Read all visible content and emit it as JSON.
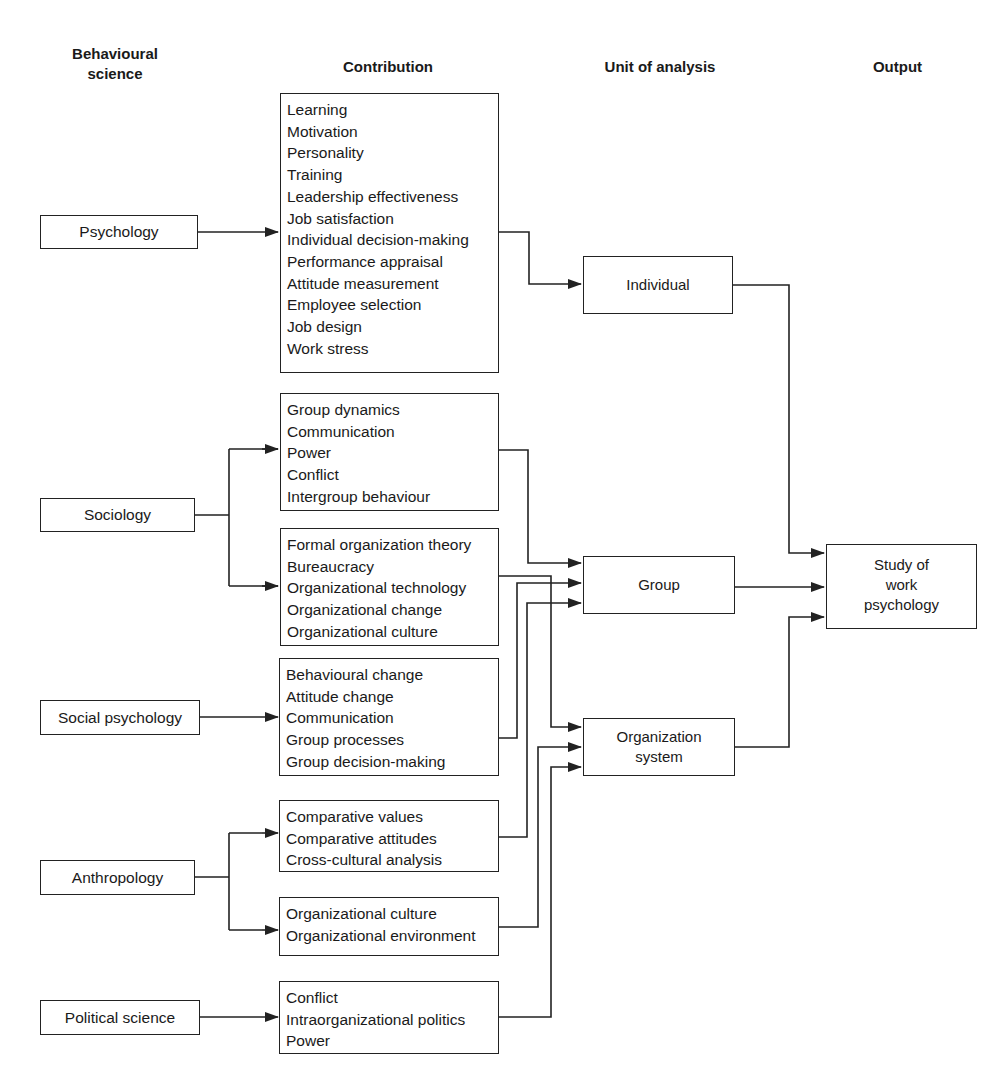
{
  "headers": {
    "behavioural_science": "Behavioural science",
    "contribution": "Contribution",
    "unit_of_analysis": "Unit of analysis",
    "output": "Output"
  },
  "sciences": {
    "psychology": "Psychology",
    "sociology": "Sociology",
    "social_psychology": "Social psychology",
    "anthropology": "Anthropology",
    "political_science": "Political science"
  },
  "contributions": {
    "psychology": [
      "Learning",
      "Motivation",
      "Personality",
      "Training",
      "Leadership effectiveness",
      "Job satisfaction",
      "Individual decision-making",
      "Performance appraisal",
      "Attitude measurement",
      "Employee selection",
      "Job design",
      "Work stress"
    ],
    "sociology_1": [
      "Group dynamics",
      "Communication",
      "Power",
      "Conflict",
      "Intergroup behaviour"
    ],
    "sociology_2": [
      "Formal organization theory",
      "Bureaucracy",
      "Organizational technology",
      "Organizational change",
      "Organizational culture"
    ],
    "social_psychology": [
      "Behavioural change",
      "Attitude change",
      "Communication",
      "Group processes",
      "Group decision-making"
    ],
    "anthropology_1": [
      "Comparative values",
      "Comparative attitudes",
      "Cross-cultural analysis"
    ],
    "anthropology_2": [
      "Organizational culture",
      "Organizational environment"
    ],
    "political_science": [
      "Conflict",
      "Intraorganizational politics",
      "Power"
    ]
  },
  "units": {
    "individual": "Individual",
    "group": "Group",
    "organization_line1": "Organization",
    "organization_line2": "system"
  },
  "output": {
    "line1": "Study of",
    "line2": "work",
    "line3": "psychology"
  },
  "flows": [
    {
      "from": "Psychology",
      "to": "Contribution: psychology"
    },
    {
      "from": "Sociology",
      "to": "Contribution: sociology_1"
    },
    {
      "from": "Sociology",
      "to": "Contribution: sociology_2"
    },
    {
      "from": "Social psychology",
      "to": "Contribution: social_psychology"
    },
    {
      "from": "Anthropology",
      "to": "Contribution: anthropology_1"
    },
    {
      "from": "Anthropology",
      "to": "Contribution: anthropology_2"
    },
    {
      "from": "Political science",
      "to": "Contribution: political_science"
    },
    {
      "from": "Contribution: psychology",
      "to": "Individual"
    },
    {
      "from": "Contribution: sociology_1",
      "to": "Group"
    },
    {
      "from": "Contribution: social_psychology",
      "to": "Group"
    },
    {
      "from": "Contribution: anthropology_1",
      "to": "Group"
    },
    {
      "from": "Contribution: sociology_2",
      "to": "Organization system"
    },
    {
      "from": "Contribution: anthropology_2",
      "to": "Organization system"
    },
    {
      "from": "Contribution: political_science",
      "to": "Organization system"
    },
    {
      "from": "Individual",
      "to": "Study of work psychology"
    },
    {
      "from": "Group",
      "to": "Study of work psychology"
    },
    {
      "from": "Organization system",
      "to": "Study of work psychology"
    }
  ]
}
